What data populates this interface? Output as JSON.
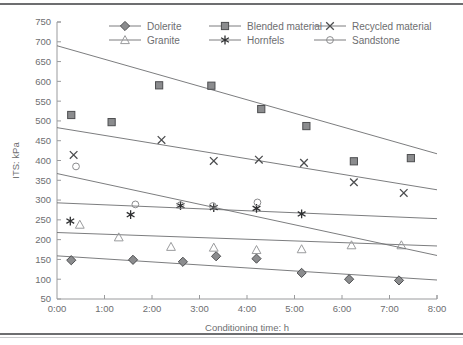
{
  "chart_data": {
    "type": "scatter",
    "title": "",
    "xlabel": "Conditioning time: h",
    "ylabel": "ITS: kPa",
    "xlim": [
      0,
      8
    ],
    "ylim": [
      50,
      750
    ],
    "ytick_step": 50,
    "grid": false,
    "legend_position": "top",
    "xticklabels": [
      "0:00",
      "1:00",
      "2:00",
      "3:00",
      "4:00",
      "5:00",
      "6:00",
      "7:00",
      "8:00"
    ],
    "xtickvalues": [
      0,
      1,
      2,
      3,
      4,
      5,
      6,
      7,
      8
    ],
    "yticklabels": [
      "50",
      "100",
      "150",
      "200",
      "250",
      "300",
      "350",
      "400",
      "450",
      "500",
      "550",
      "600",
      "650",
      "700",
      "750"
    ],
    "ytickvalues": [
      50,
      100,
      150,
      200,
      250,
      300,
      350,
      400,
      450,
      500,
      550,
      600,
      650,
      700,
      750
    ],
    "series": [
      {
        "name": "Dolerite",
        "marker": "filled-diamond",
        "color": "#6d6e70",
        "points": [
          {
            "x": 0.3,
            "y": 148
          },
          {
            "x": 1.6,
            "y": 149
          },
          {
            "x": 2.65,
            "y": 144
          },
          {
            "x": 3.35,
            "y": 158
          },
          {
            "x": 4.2,
            "y": 152
          },
          {
            "x": 5.15,
            "y": 116
          },
          {
            "x": 6.15,
            "y": 100
          },
          {
            "x": 7.2,
            "y": 97
          }
        ],
        "trendline": {
          "x0": 0,
          "y0": 159,
          "x1": 8,
          "y1": 98
        }
      },
      {
        "name": "Blended material",
        "marker": "filled-square",
        "color": "#6d6e70",
        "points": [
          {
            "x": 0.3,
            "y": 515
          },
          {
            "x": 1.15,
            "y": 497
          },
          {
            "x": 2.15,
            "y": 590
          },
          {
            "x": 3.25,
            "y": 589
          },
          {
            "x": 4.3,
            "y": 530
          },
          {
            "x": 5.25,
            "y": 487
          },
          {
            "x": 6.25,
            "y": 398
          },
          {
            "x": 7.45,
            "y": 406
          }
        ],
        "trendline": {
          "x0": 0,
          "y0": 690,
          "x1": 8,
          "y1": 417
        }
      },
      {
        "name": "Recycled material",
        "marker": "cross-x",
        "color": "#58585a",
        "points": [
          {
            "x": 0.35,
            "y": 414
          },
          {
            "x": 2.2,
            "y": 452
          },
          {
            "x": 3.3,
            "y": 399
          },
          {
            "x": 4.25,
            "y": 402
          },
          {
            "x": 5.2,
            "y": 394
          },
          {
            "x": 6.25,
            "y": 345
          },
          {
            "x": 7.3,
            "y": 318
          }
        ],
        "trendline": {
          "x0": 0,
          "y0": 483,
          "x1": 8,
          "y1": 326
        }
      },
      {
        "name": "Granite",
        "marker": "open-triangle",
        "color": "#9a9b9d",
        "points": [
          {
            "x": 0.48,
            "y": 238
          },
          {
            "x": 1.3,
            "y": 206
          },
          {
            "x": 2.4,
            "y": 182
          },
          {
            "x": 3.3,
            "y": 180
          },
          {
            "x": 4.2,
            "y": 174
          },
          {
            "x": 5.15,
            "y": 176
          },
          {
            "x": 6.2,
            "y": 186
          },
          {
            "x": 7.25,
            "y": 186
          }
        ],
        "trendline": {
          "x0": 0,
          "y0": 218,
          "x1": 8,
          "y1": 184
        }
      },
      {
        "name": "Hornfels",
        "marker": "asterisk",
        "color": "#3f4042",
        "points": [
          {
            "x": 0.28,
            "y": 247
          },
          {
            "x": 1.55,
            "y": 263
          },
          {
            "x": 2.6,
            "y": 286
          },
          {
            "x": 3.3,
            "y": 281
          },
          {
            "x": 4.2,
            "y": 279
          },
          {
            "x": 5.15,
            "y": 265
          }
        ],
        "trendline": {
          "x0": 0,
          "y0": 293,
          "x1": 8,
          "y1": 253
        }
      },
      {
        "name": "Sandstone",
        "marker": "open-circle",
        "color": "#9a9b9d",
        "points": [
          {
            "x": 0.4,
            "y": 385
          },
          {
            "x": 1.65,
            "y": 289
          },
          {
            "x": 2.6,
            "y": 287
          },
          {
            "x": 3.28,
            "y": 285
          },
          {
            "x": 4.22,
            "y": 294
          }
        ],
        "trendline": {
          "x0": 0,
          "y0": 367,
          "x1": 8,
          "y1": 160
        }
      }
    ]
  },
  "legend": {
    "items": [
      {
        "label": "Dolerite",
        "marker": "filled-diamond"
      },
      {
        "label": "Blended material",
        "marker": "filled-square"
      },
      {
        "label": "Recycled material",
        "marker": "cross-x"
      },
      {
        "label": "Granite",
        "marker": "open-triangle"
      },
      {
        "label": "Hornfels",
        "marker": "asterisk"
      },
      {
        "label": "Sandstone",
        "marker": "open-circle"
      }
    ]
  },
  "colors": {
    "axis": "#9a9b9d",
    "text": "#6d6e70",
    "marker_fill": "#8b8c8e",
    "line": "#6d6e70",
    "rule": "#6d6e70"
  }
}
